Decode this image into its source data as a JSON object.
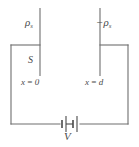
{
  "figure": {
    "type": "circuit-diagram",
    "background_color": "#ffffff",
    "line_color": "#6e6e6e",
    "text_color": "#4a4a4a"
  },
  "labels": {
    "charge_density_left": "ρ",
    "charge_density_left_sub": "s",
    "charge_density_right": "−ρ",
    "charge_density_right_sub": "s",
    "surface": "S",
    "position_left": "x = 0",
    "position_right": "x = d",
    "voltage": "V"
  },
  "elements": {
    "plate_left_name": "capacitor-plate-left",
    "plate_right_name": "capacitor-plate-right",
    "battery_name": "battery-symbol",
    "wire_name": "circuit-wire"
  },
  "geometry": {
    "width": 139,
    "height": 147,
    "plate_left_x": 40,
    "plate_right_x": 100,
    "plate_top_y": 8,
    "plate_bottom_y": 76,
    "wire_top_y": 45,
    "wire_bottom_y": 124,
    "wire_left_x": 11,
    "wire_right_x": 128,
    "battery_center_x": 70
  }
}
